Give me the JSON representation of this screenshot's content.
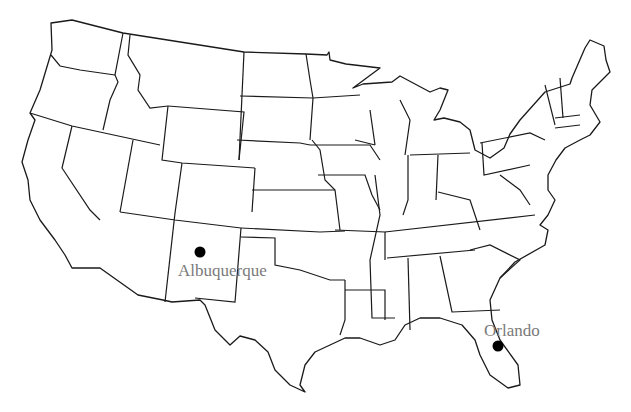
{
  "map": {
    "title": "Contiguous United States",
    "style": {
      "line_color": "#1a1a1a",
      "background": "#ffffff",
      "label_color": "#7a7a7a",
      "dot_color": "#000000"
    },
    "cities": [
      {
        "name": "Albuquerque",
        "state": "New Mexico",
        "dot": {
          "x": 200,
          "y": 252
        },
        "label": {
          "x": 178,
          "y": 262
        }
      },
      {
        "name": "Orlando",
        "state": "Florida",
        "dot": {
          "x": 498,
          "y": 346
        },
        "label": {
          "x": 484,
          "y": 322
        }
      }
    ]
  }
}
